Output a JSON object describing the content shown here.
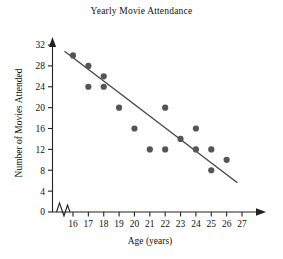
{
  "chart_data": {
    "type": "scatter",
    "title": "Yearly Movie Attendance",
    "xlabel": "Age (years)",
    "ylabel": "Number of Movies Attended",
    "xlim": [
      15.4,
      27.6
    ],
    "ylim": [
      0,
      33
    ],
    "xticks": [
      16,
      17,
      18,
      19,
      20,
      21,
      22,
      23,
      24,
      25,
      26,
      27
    ],
    "yticks": [
      0,
      4,
      8,
      12,
      16,
      20,
      24,
      28,
      32
    ],
    "grid": false,
    "legend": null,
    "axis_break": {
      "axis": "x",
      "symbol": "zigzag",
      "between": [
        15.4,
        15.9
      ]
    },
    "points": [
      {
        "x": 16,
        "y": 30
      },
      {
        "x": 17,
        "y": 28
      },
      {
        "x": 17,
        "y": 24
      },
      {
        "x": 18,
        "y": 26
      },
      {
        "x": 18,
        "y": 24
      },
      {
        "x": 19,
        "y": 20
      },
      {
        "x": 20,
        "y": 16
      },
      {
        "x": 21,
        "y": 12
      },
      {
        "x": 22,
        "y": 20
      },
      {
        "x": 22,
        "y": 12
      },
      {
        "x": 23,
        "y": 14
      },
      {
        "x": 24,
        "y": 16
      },
      {
        "x": 24,
        "y": 12
      },
      {
        "x": 25,
        "y": 12
      },
      {
        "x": 25,
        "y": 8
      },
      {
        "x": 26,
        "y": 10
      }
    ],
    "trend_line": {
      "name": "line of best fit",
      "x_start": 15.45,
      "y_start": 30.8,
      "x_end": 26.7,
      "y_end": 5.6
    },
    "colors": {
      "point": "#555555",
      "line": "#444444",
      "axis": "#222222",
      "text": "#111111"
    }
  }
}
